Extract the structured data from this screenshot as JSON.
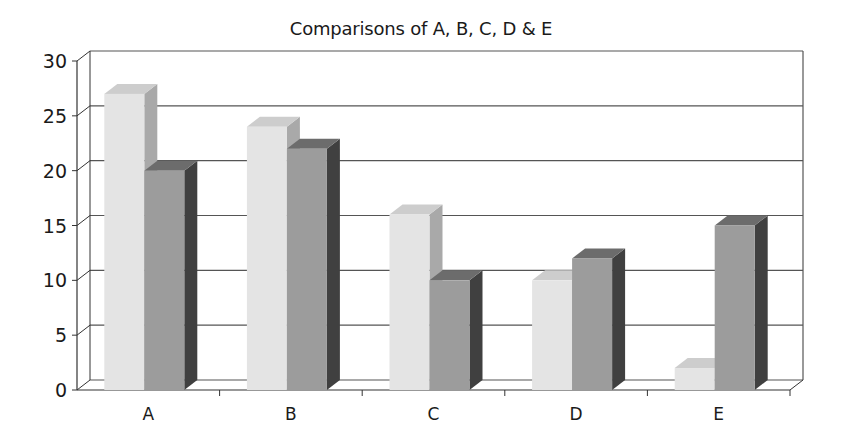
{
  "chart_data": {
    "type": "bar",
    "style": "3d-clustered-column",
    "title": "Comparisons of A, B, C, D & E",
    "xlabel": "",
    "ylabel": "",
    "categories": [
      "A",
      "B",
      "C",
      "D",
      "E"
    ],
    "series": [
      {
        "name": "Series 1",
        "values": [
          27,
          24,
          16,
          10,
          2
        ]
      },
      {
        "name": "Series 2",
        "values": [
          20,
          22,
          10,
          12,
          15
        ]
      }
    ],
    "ylim": [
      0,
      30
    ],
    "yticks": [
      0,
      5,
      10,
      15,
      20,
      25,
      30
    ],
    "grid": true,
    "legend": "none"
  },
  "colors": {
    "series1_front": "#e4e4e4",
    "series1_side": "#a9a9a9",
    "series1_top": "#cdcdcd",
    "series2_front": "#9c9c9c",
    "series2_side": "#404040",
    "series2_top": "#6c6c6c",
    "grid": "#555555",
    "axis": "#333333"
  }
}
